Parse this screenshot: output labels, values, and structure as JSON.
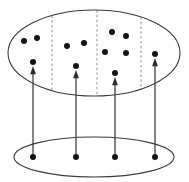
{
  "figure": {
    "canvas": {
      "width": 189,
      "height": 182,
      "background": "#ffffff"
    },
    "colors": {
      "outline": "#3a3a3a",
      "dashed_partition": "#9a9a9a",
      "arrow": "#2b2b2b",
      "dot": "#141414",
      "background": "#ffffff"
    }
  },
  "chart_data": {
    "type": "scatter",
    "title": "",
    "subtitle": "",
    "xlabel": "",
    "ylabel": "",
    "grid": false,
    "legend": false,
    "xlim": [
      0,
      189
    ],
    "ylim": [
      0,
      182
    ],
    "annotations": [],
    "shapes": {
      "total_space_ellipse": {
        "name": "total-space-ellipse",
        "cx": 94,
        "cy": 53,
        "rx": 86,
        "ry": 43
      },
      "base_space_ellipse": {
        "name": "base-space-ellipse",
        "cx": 94,
        "cy": 157,
        "rx": 80,
        "ry": 20
      },
      "partitions": [
        {
          "name": "partition-1",
          "x": 52
        },
        {
          "name": "partition-2",
          "x": 97
        },
        {
          "name": "partition-3",
          "x": 141
        }
      ]
    },
    "series": [
      {
        "name": "total-space-points",
        "marker": "filled-circle",
        "marker_radius": 3.0,
        "color": "#141414",
        "count": 12,
        "points": [
          {
            "x": 24,
            "y": 41,
            "region": 1
          },
          {
            "x": 37,
            "y": 38,
            "region": 1
          },
          {
            "x": 33,
            "y": 62,
            "region": 1
          },
          {
            "x": 67,
            "y": 46,
            "region": 2
          },
          {
            "x": 84,
            "y": 43,
            "region": 2
          },
          {
            "x": 76,
            "y": 66,
            "region": 2
          },
          {
            "x": 112,
            "y": 32,
            "region": 3
          },
          {
            "x": 126,
            "y": 36,
            "region": 3
          },
          {
            "x": 105,
            "y": 52,
            "region": 3
          },
          {
            "x": 126,
            "y": 53,
            "region": 3
          },
          {
            "x": 115,
            "y": 73,
            "region": 3
          },
          {
            "x": 155,
            "y": 54,
            "region": 4
          }
        ]
      },
      {
        "name": "base-space-points",
        "marker": "filled-circle",
        "marker_radius": 3.0,
        "color": "#141414",
        "count": 4,
        "points": [
          {
            "x": 33,
            "y": 157,
            "region": 1
          },
          {
            "x": 76,
            "y": 157,
            "region": 2
          },
          {
            "x": 115,
            "y": 157,
            "region": 3
          },
          {
            "x": 155,
            "y": 157,
            "region": 4
          }
        ]
      }
    ],
    "arrows": [
      {
        "name": "section-arrow-1",
        "x": 33,
        "y_start": 157,
        "y_end": 66
      },
      {
        "name": "section-arrow-2",
        "x": 76,
        "y_start": 157,
        "y_end": 70
      },
      {
        "name": "section-arrow-3",
        "x": 115,
        "y_start": 157,
        "y_end": 77
      },
      {
        "name": "section-arrow-4",
        "x": 155,
        "y_start": 157,
        "y_end": 58
      }
    ]
  }
}
